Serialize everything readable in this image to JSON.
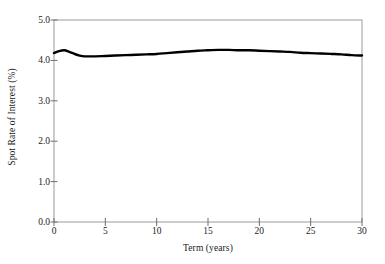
{
  "chart_data": {
    "type": "line",
    "title": "",
    "xlabel": "Term (years)",
    "ylabel": "Spot Rate of Interest (%)",
    "xlim": [
      0,
      30
    ],
    "ylim": [
      0.0,
      5.0
    ],
    "xticks": [
      "0",
      "5",
      "10",
      "15",
      "20",
      "25",
      "30"
    ],
    "xtick_values": [
      0,
      5,
      10,
      15,
      20,
      25,
      30
    ],
    "yticks": [
      "0.0",
      "1.0",
      "2.0",
      "3.0",
      "4.0",
      "5.0"
    ],
    "ytick_values": [
      0.0,
      1.0,
      2.0,
      3.0,
      4.0,
      5.0
    ],
    "grid": false,
    "legend": null,
    "legend_position": "none",
    "line_color": "#000000",
    "frame_color": "#9a9a9a",
    "series": [
      {
        "name": "Spot rate curve",
        "x": [
          0.0,
          0.5,
          1.0,
          1.5,
          2.0,
          2.5,
          3.0,
          3.5,
          4.0,
          5.0,
          6.0,
          7.0,
          8.0,
          9.0,
          10.0,
          11.0,
          12.0,
          13.0,
          14.0,
          15.0,
          16.0,
          17.0,
          18.0,
          19.0,
          20.0,
          21.0,
          22.0,
          23.0,
          24.0,
          25.0,
          26.0,
          27.0,
          28.0,
          29.0,
          30.0
        ],
        "values": [
          4.18,
          4.23,
          4.25,
          4.21,
          4.16,
          4.12,
          4.1,
          4.1,
          4.1,
          4.11,
          4.12,
          4.13,
          4.14,
          4.15,
          4.16,
          4.18,
          4.2,
          4.22,
          4.24,
          4.25,
          4.26,
          4.26,
          4.25,
          4.25,
          4.24,
          4.23,
          4.22,
          4.21,
          4.19,
          4.18,
          4.17,
          4.16,
          4.15,
          4.13,
          4.12
        ]
      }
    ]
  },
  "axes": {
    "ylabel_text": "Spot Rate of Interest (%)",
    "xlabel_text": "Term (years)"
  }
}
